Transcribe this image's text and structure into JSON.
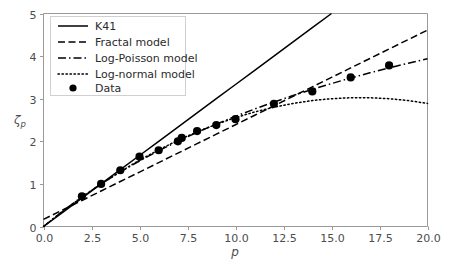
{
  "chart_data": {
    "type": "line",
    "title": "",
    "subtitle": "",
    "xlabel": "p",
    "ylabel": "ζp",
    "ylabel_base": "ζ",
    "ylabel_sub": "p",
    "xlim": [
      0.0,
      20.0
    ],
    "ylim": [
      0.0,
      5.0
    ],
    "grid": false,
    "legend_position": "upper left",
    "xticks": [
      0.0,
      2.5,
      5.0,
      7.5,
      10.0,
      12.5,
      15.0,
      17.5,
      20.0
    ],
    "xticklabels": [
      "0.0",
      "2.5",
      "5.0",
      "7.5",
      "10.0",
      "12.5",
      "15.0",
      "17.5",
      "20.0"
    ],
    "yticks": [
      0,
      1,
      2,
      3,
      4,
      5
    ],
    "yticklabels": [
      "0",
      "1",
      "2",
      "3",
      "4",
      "5"
    ],
    "series": [
      {
        "name": "K41",
        "style": "solid",
        "color": "#000000",
        "x": [
          0.0,
          1.0,
          2.0,
          3.0,
          4.0,
          5.0,
          6.0,
          7.0,
          8.0,
          9.0,
          10.0,
          11.0,
          12.0,
          13.0,
          14.0,
          15.0
        ],
        "values": [
          0.0,
          0.333,
          0.667,
          1.0,
          1.333,
          1.667,
          2.0,
          2.333,
          2.667,
          3.0,
          3.333,
          3.667,
          4.0,
          4.333,
          4.667,
          5.0
        ]
      },
      {
        "name": "Fractal model",
        "style": "dashed",
        "color": "#000000",
        "x": [
          0.0,
          1.0,
          2.0,
          3.0,
          4.0,
          5.0,
          6.0,
          7.0,
          8.0,
          9.0,
          10.0,
          11.0,
          12.0,
          13.0,
          14.0,
          15.0,
          16.0,
          17.0,
          18.0,
          19.0,
          20.0
        ],
        "values": [
          0.167,
          0.389,
          0.611,
          0.833,
          1.056,
          1.278,
          1.5,
          1.722,
          1.944,
          2.167,
          2.389,
          2.611,
          2.833,
          3.056,
          3.278,
          3.5,
          3.722,
          3.944,
          4.167,
          4.389,
          4.611
        ]
      },
      {
        "name": "Log-Poisson model",
        "style": "dashdot",
        "color": "#000000",
        "x": [
          0.0,
          1.0,
          2.0,
          3.0,
          4.0,
          5.0,
          6.0,
          7.0,
          8.0,
          9.0,
          10.0,
          11.0,
          12.0,
          13.0,
          14.0,
          15.0,
          16.0,
          17.0,
          18.0,
          19.0,
          20.0
        ],
        "values": [
          0.0,
          0.364,
          0.696,
          1.0,
          1.28,
          1.538,
          1.778,
          2.001,
          2.209,
          2.404,
          2.587,
          2.759,
          2.921,
          3.074,
          3.219,
          3.355,
          3.485,
          3.607,
          3.724,
          3.834,
          3.939
        ]
      },
      {
        "name": "Log-normal model",
        "style": "dotted",
        "color": "#000000",
        "x": [
          0.0,
          1.0,
          2.0,
          3.0,
          4.0,
          5.0,
          6.0,
          7.0,
          8.0,
          9.0,
          10.0,
          11.0,
          12.0,
          13.0,
          14.0,
          15.0,
          16.0,
          17.0,
          18.0,
          19.0,
          20.0
        ],
        "values": [
          0.0,
          0.356,
          0.691,
          1.0,
          1.289,
          1.556,
          1.8,
          2.022,
          2.222,
          2.4,
          2.556,
          2.689,
          2.8,
          2.889,
          2.956,
          3.0,
          3.022,
          3.022,
          3.0,
          2.956,
          2.889
        ]
      }
    ],
    "scatter": {
      "name": "Data",
      "marker": "circle",
      "color": "#000000",
      "x": [
        2.0,
        3.0,
        4.0,
        5.0,
        6.0,
        7.0,
        7.2,
        8.0,
        9.0,
        10.0,
        12.0,
        14.0,
        16.0,
        18.0
      ],
      "values": [
        0.71,
        1.0,
        1.32,
        1.64,
        1.79,
        2.0,
        2.08,
        2.24,
        2.38,
        2.52,
        2.88,
        3.17,
        3.5,
        3.78
      ]
    },
    "legend_entries": [
      {
        "label": "K41",
        "style": "solid"
      },
      {
        "label": "Fractal model",
        "style": "dashed"
      },
      {
        "label": "Log-Poisson model",
        "style": "dashdot"
      },
      {
        "label": "Log-normal model",
        "style": "dotted"
      },
      {
        "label": "Data",
        "style": "marker"
      }
    ]
  }
}
